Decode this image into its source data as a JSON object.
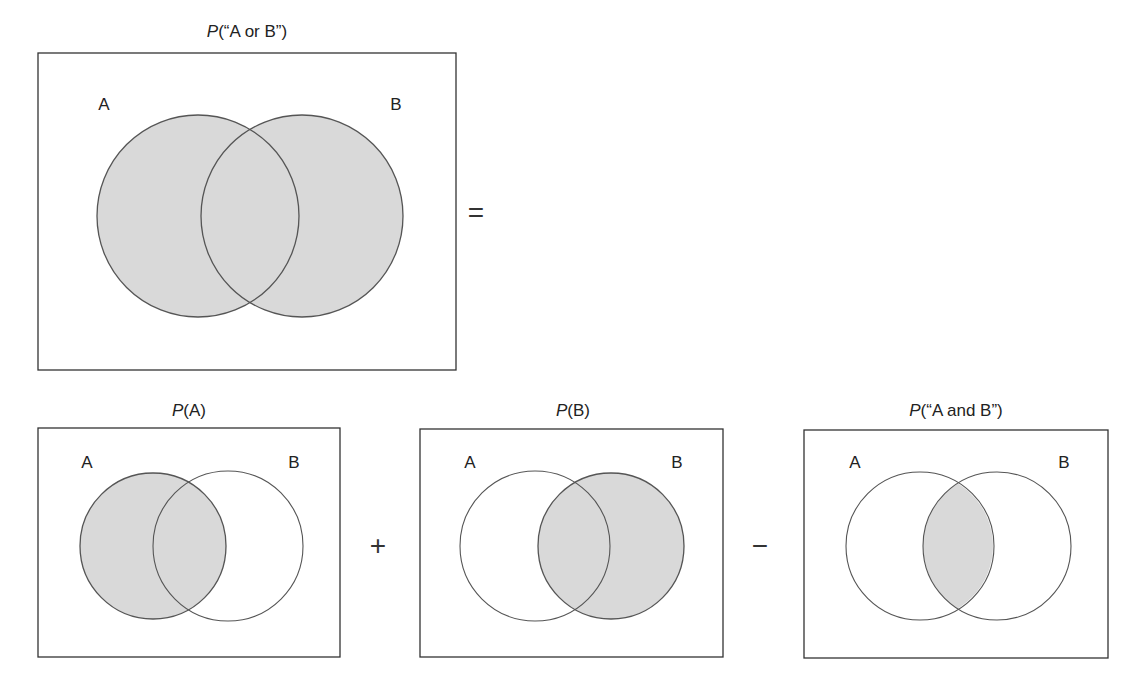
{
  "panels": {
    "union": {
      "title_prefix": "P",
      "title_rest": "(“A or B”)",
      "label_a": "A",
      "label_b": "B",
      "shade": "union"
    },
    "a": {
      "title_prefix": "P",
      "title_rest": "(A)",
      "label_a": "A",
      "label_b": "B",
      "shade": "A"
    },
    "b": {
      "title_prefix": "P",
      "title_rest": "(B)",
      "label_a": "A",
      "label_b": "B",
      "shade": "B"
    },
    "ab": {
      "title_prefix": "P",
      "title_rest": "(“A and B”)",
      "label_a": "A",
      "label_b": "B",
      "shade": "intersection"
    }
  },
  "operators": {
    "equals": "=",
    "plus": "+",
    "minus": "−"
  },
  "colors": {
    "fill": "#d9d9d9",
    "stroke": "#555555",
    "frame": "#333333"
  }
}
